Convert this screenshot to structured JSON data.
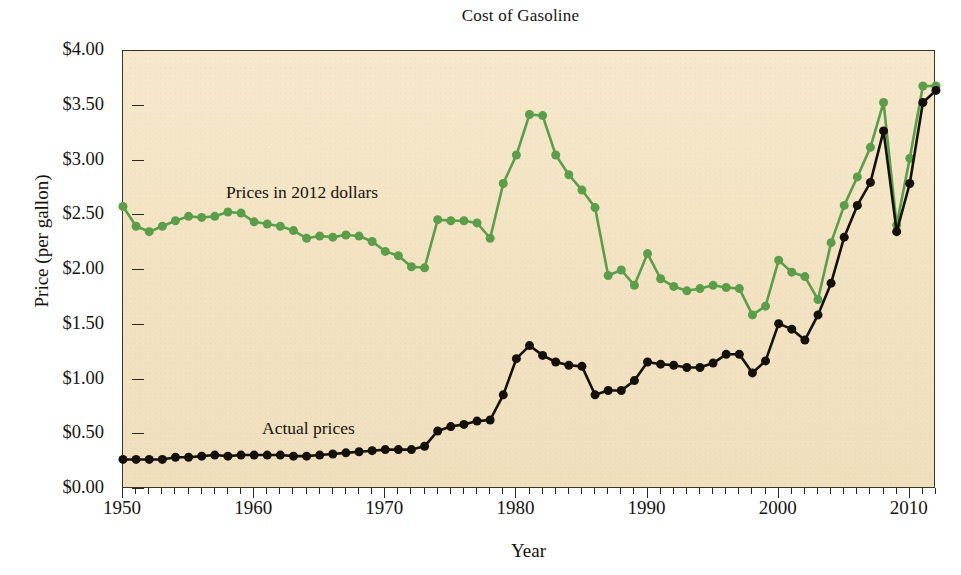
{
  "chart_data": {
    "type": "line",
    "title": "Cost of Gasoline",
    "xlabel": "Year",
    "ylabel": "Price (per gallon)",
    "xlim": [
      1950,
      2012
    ],
    "ylim": [
      0,
      4
    ],
    "xtick_step_major": 10,
    "xtick_step_minor": 1,
    "ytick_step": 0.5,
    "grid": false,
    "legend_position": "inline-annotations",
    "xticks": [
      "1950",
      "1960",
      "1970",
      "1980",
      "1990",
      "2000",
      "2010"
    ],
    "xtick_values": [
      1950,
      1960,
      1970,
      1980,
      1990,
      2000,
      2010
    ],
    "yticks": [
      "$0.00",
      "$0.50",
      "$1.00",
      "$1.50",
      "$2.00",
      "$2.50",
      "$3.00",
      "$3.50",
      "$4.00"
    ],
    "ytick_values": [
      0,
      0.5,
      1,
      1.5,
      2,
      2.5,
      3,
      3.5,
      4
    ],
    "colors": {
      "inflation_adjusted": "#5a9e4a",
      "actual": "#14110c",
      "plot_background": "#f2e2c1",
      "axis": "#2c271f",
      "text": "#171310"
    },
    "annotations": [
      {
        "text": "Prices in 2012 dollars",
        "series": "inflation_adjusted"
      },
      {
        "text": "Actual prices",
        "series": "actual"
      }
    ],
    "x": [
      1950,
      1951,
      1952,
      1953,
      1954,
      1955,
      1956,
      1957,
      1958,
      1959,
      1960,
      1961,
      1962,
      1963,
      1964,
      1965,
      1966,
      1967,
      1968,
      1969,
      1970,
      1971,
      1972,
      1973,
      1974,
      1975,
      1976,
      1977,
      1978,
      1979,
      1980,
      1981,
      1982,
      1983,
      1984,
      1985,
      1986,
      1987,
      1988,
      1989,
      1990,
      1991,
      1992,
      1993,
      1994,
      1995,
      1996,
      1997,
      1998,
      1999,
      2000,
      2001,
      2002,
      2003,
      2004,
      2005,
      2006,
      2007,
      2008,
      2009,
      2010,
      2011,
      2012
    ],
    "series": [
      {
        "name": "Prices in 2012 dollars",
        "key": "inflation_adjusted",
        "color": "#5a9e4a",
        "values": [
          2.58,
          2.4,
          2.35,
          2.4,
          2.45,
          2.49,
          2.48,
          2.49,
          2.53,
          2.52,
          2.44,
          2.42,
          2.4,
          2.36,
          2.29,
          2.31,
          2.3,
          2.32,
          2.31,
          2.26,
          2.17,
          2.13,
          2.03,
          2.02,
          2.46,
          2.45,
          2.45,
          2.43,
          2.29,
          2.79,
          3.05,
          3.42,
          3.41,
          3.05,
          2.87,
          2.73,
          2.57,
          1.95,
          2.0,
          1.86,
          2.15,
          1.92,
          1.85,
          1.81,
          1.83,
          1.86,
          1.84,
          1.83,
          1.59,
          1.67,
          2.09,
          1.98,
          1.94,
          1.73,
          2.25,
          2.59,
          2.85,
          3.12,
          3.53,
          2.41,
          3.02,
          3.68,
          3.68
        ]
      },
      {
        "name": "Actual prices",
        "key": "actual",
        "color": "#14110c",
        "values": [
          0.27,
          0.27,
          0.27,
          0.27,
          0.29,
          0.29,
          0.3,
          0.31,
          0.3,
          0.31,
          0.31,
          0.31,
          0.31,
          0.3,
          0.3,
          0.31,
          0.32,
          0.33,
          0.34,
          0.35,
          0.36,
          0.36,
          0.36,
          0.39,
          0.53,
          0.57,
          0.59,
          0.62,
          0.63,
          0.86,
          1.19,
          1.31,
          1.22,
          1.16,
          1.13,
          1.12,
          0.86,
          0.9,
          0.9,
          0.99,
          1.16,
          1.14,
          1.13,
          1.11,
          1.11,
          1.15,
          1.23,
          1.23,
          1.06,
          1.17,
          1.51,
          1.46,
          1.36,
          1.59,
          1.88,
          2.3,
          2.59,
          2.8,
          3.27,
          2.35,
          2.79,
          3.53,
          3.64
        ]
      }
    ]
  }
}
